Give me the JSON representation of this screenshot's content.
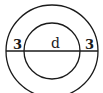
{
  "diagram": {
    "type": "concentric-circles",
    "stroke_color": "#1a1a1a",
    "background": "#ffffff",
    "center": {
      "x": 52,
      "y": 51
    },
    "outer_circle": {
      "radius": 46
    },
    "inner_circle": {
      "radius": 28
    },
    "labels": {
      "left_ring_width": "3",
      "inner_diameter": "d",
      "right_ring_width": "3"
    }
  }
}
